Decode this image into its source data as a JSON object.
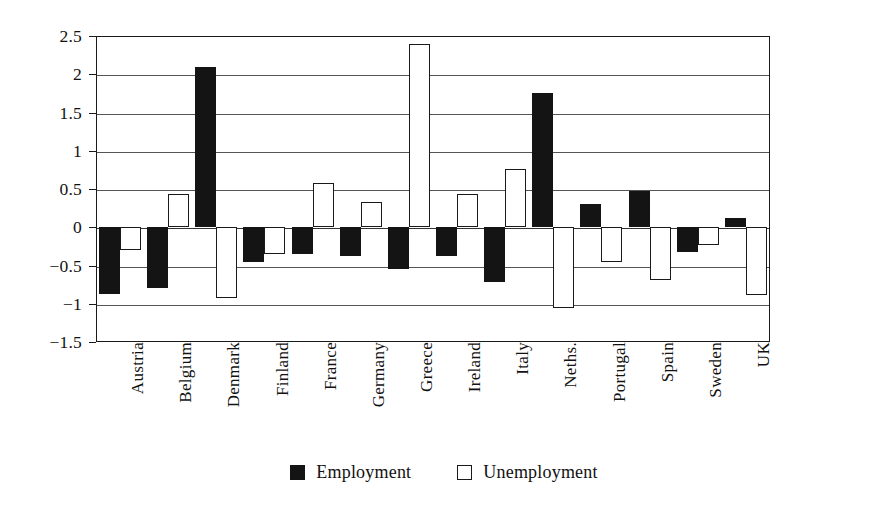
{
  "chart_data": {
    "type": "bar",
    "title": "",
    "subtitle": "",
    "xlabel": "",
    "ylabel": "",
    "ylim": [
      -1.5,
      2.5
    ],
    "ytick_values": [
      2.5,
      2,
      1.5,
      1,
      0.5,
      0,
      -0.5,
      -1,
      -1.5
    ],
    "ytick_labels": [
      "2.5",
      "2",
      "1.5",
      "1",
      "0.5",
      "0",
      "−0.5",
      "−1",
      "−1.5"
    ],
    "grid": true,
    "legend_position": "bottom-center",
    "categories": [
      "Austria",
      "Belgium",
      "Denmark",
      "Finland",
      "France",
      "Germany",
      "Greece",
      "Ireland",
      "Italy",
      "Neths.",
      "Portugal",
      "Spain",
      "Sweden",
      "UK"
    ],
    "series": [
      {
        "name": "Employment",
        "color": "#141414",
        "style": "filled",
        "values": [
          -0.87,
          -0.8,
          2.1,
          -0.45,
          -0.35,
          -0.38,
          -0.55,
          -0.38,
          -0.72,
          1.75,
          0.31,
          0.48,
          -0.32,
          0.12
        ]
      },
      {
        "name": "Unemployment",
        "color": "#ffffff",
        "style": "hollow",
        "values": [
          -0.3,
          0.43,
          -0.93,
          -0.35,
          0.58,
          0.33,
          2.4,
          0.43,
          0.76,
          -1.05,
          -0.46,
          -0.69,
          -0.23,
          -0.88
        ]
      }
    ]
  },
  "legend": {
    "items": [
      {
        "label": "Employment",
        "style": "filled"
      },
      {
        "label": "Unemployment",
        "style": "hollow"
      }
    ]
  }
}
